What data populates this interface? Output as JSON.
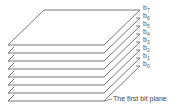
{
  "diagram": {
    "planes": [
      {
        "label": "b7"
      },
      {
        "label": "b6"
      },
      {
        "label": "b5"
      },
      {
        "label": "b4"
      },
      {
        "label": "b3"
      },
      {
        "label": "b2"
      },
      {
        "label": "b1"
      },
      {
        "label": "b0"
      }
    ],
    "caption": "The first bit plane",
    "stroke_color": "#555555"
  }
}
